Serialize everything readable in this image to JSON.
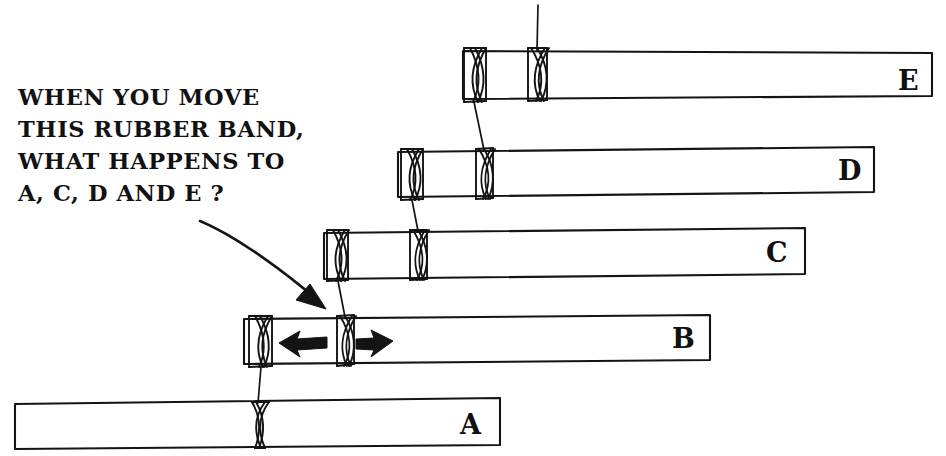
{
  "diagram": {
    "question": {
      "name": "question-text",
      "lines": [
        "WHEN YOU MOVE",
        "THIS RUBBER BAND,",
        "WHAT HAPPENS TO",
        "A, C, D AND E ?"
      ],
      "x": 18,
      "line_y": [
        105,
        137,
        169,
        201
      ]
    },
    "ink_color": "#141414",
    "background_color": "#ffffff",
    "bars": [
      {
        "id": "A",
        "label": "A",
        "label_x": 460,
        "label_y": 434,
        "x1": 15,
        "x2": 500,
        "y_top_left": 404,
        "y_top_right": 398,
        "y_bottom_left": 449,
        "y_bottom_right": 445,
        "bands": [
          258
        ]
      },
      {
        "id": "B",
        "label": "B",
        "label_x": 672,
        "label_y": 348,
        "x1": 244,
        "x2": 710,
        "y_top_left": 319,
        "y_top_right": 315,
        "y_bottom_left": 364,
        "y_bottom_right": 360,
        "bands": [
          260,
          345
        ],
        "arrows": [
          {
            "name": "arrow-left",
            "direction": "left",
            "tip_x": 280,
            "tail_x": 326,
            "y": 343
          },
          {
            "name": "arrow-right",
            "direction": "right",
            "tip_x": 392,
            "tail_x": 357,
            "y": 343
          }
        ]
      },
      {
        "id": "C",
        "label": "C",
        "label_x": 766,
        "label_y": 262,
        "x1": 324,
        "x2": 805,
        "y_top_left": 233,
        "y_top_right": 228,
        "y_bottom_left": 279,
        "y_bottom_right": 274,
        "bands": [
          337,
          418
        ]
      },
      {
        "id": "D",
        "label": "D",
        "label_x": 838,
        "label_y": 180,
        "x1": 398,
        "x2": 874,
        "y_top_left": 152,
        "y_top_right": 147,
        "y_bottom_left": 197,
        "y_bottom_right": 192,
        "bands": [
          412,
          484
        ]
      },
      {
        "id": "E",
        "label": "E",
        "label_x": 898,
        "label_y": 90,
        "x1": 463,
        "x2": 932,
        "y_top_left": 51,
        "y_top_right": 53,
        "y_bottom_left": 99,
        "y_bottom_right": 96,
        "bands": [
          473,
          537
        ]
      }
    ],
    "connectors": [
      {
        "name": "connector-e-to-d",
        "x_top": 473,
        "y_top": 100,
        "x_bottom": 484,
        "y_bottom": 151
      },
      {
        "name": "connector-d-to-c",
        "x_top": 412,
        "y_top": 198,
        "x_bottom": 418,
        "y_bottom": 232
      },
      {
        "name": "connector-c-to-b",
        "x_top": 337,
        "y_top": 280,
        "x_bottom": 345,
        "y_bottom": 318
      },
      {
        "name": "connector-b-to-a",
        "x_top": 260,
        "y_top": 365,
        "x_bottom": 258,
        "y_bottom": 403
      },
      {
        "name": "connector-e-top-stem",
        "x_top": 538,
        "y_top": 5,
        "x_bottom": 537,
        "y_bottom": 52
      }
    ],
    "pointer": {
      "name": "pointer-arrow",
      "path": "M 200 221 C 238 238 285 272 320 302",
      "head": "M 320 302 L 302 296 L 312 288 Z",
      "head_points": "322,305 300,299 311,285",
      "target": "rubber band between B and C"
    }
  }
}
